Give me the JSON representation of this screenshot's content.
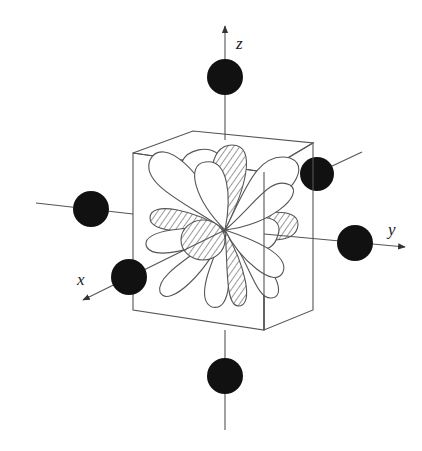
{
  "figure": {
    "axes": [
      {
        "name": "z",
        "label": "z"
      },
      {
        "name": "y",
        "label": "y"
      },
      {
        "name": "x",
        "label": "x"
      }
    ],
    "ligands": [
      {
        "position": "+z"
      },
      {
        "position": "-z"
      },
      {
        "position": "+y"
      },
      {
        "position": "-y"
      },
      {
        "position": "+x"
      },
      {
        "position": "-x"
      }
    ],
    "colors": {
      "line": "#555555",
      "ligand": "#111111",
      "background": "#ffffff"
    }
  }
}
